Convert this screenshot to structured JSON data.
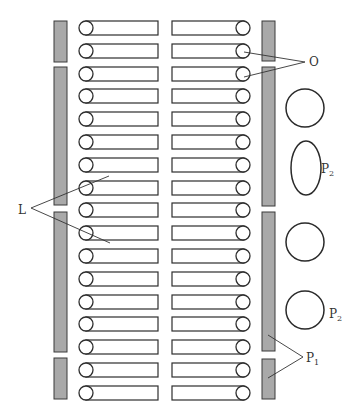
{
  "diagram": {
    "labels": {
      "O": {
        "text": "O",
        "x": 309,
        "y": 66
      },
      "L": {
        "text": "L",
        "x": 18,
        "y": 214
      },
      "P2_top": {
        "text": "P",
        "sub": "2",
        "x": 321,
        "y": 173
      },
      "P2_bottom": {
        "text": "P",
        "sub": "2",
        "x": 329,
        "y": 318
      },
      "P1": {
        "text": "P",
        "sub": "1",
        "x": 306,
        "y": 362
      }
    },
    "rows": {
      "count": 17,
      "first_y": 21,
      "pitch": 22.8,
      "height": 14
    },
    "left_bars": [
      {
        "y": 21,
        "h": 41
      },
      {
        "y": 67,
        "h": 138
      },
      {
        "y": 212,
        "h": 140
      },
      {
        "y": 358,
        "h": 41
      }
    ],
    "right_bars": [
      {
        "y": 21,
        "h": 40
      },
      {
        "y": 67,
        "h": 139
      },
      {
        "y": 212,
        "h": 139
      },
      {
        "y": 359,
        "h": 40
      }
    ],
    "shapes": [
      {
        "type": "circle",
        "cx": 305,
        "cy": 108,
        "rx": 19,
        "ry": 19
      },
      {
        "type": "ellipse",
        "cx": 306,
        "cy": 168,
        "rx": 15,
        "ry": 27
      },
      {
        "type": "circle",
        "cx": 305,
        "cy": 242,
        "rx": 19,
        "ry": 19
      },
      {
        "type": "circle",
        "cx": 305,
        "cy": 310,
        "rx": 19,
        "ry": 19
      }
    ],
    "colors": {
      "bar_fill": "#a9a9a9",
      "stroke": "#2e2e2e",
      "background": "#ffffff"
    }
  }
}
